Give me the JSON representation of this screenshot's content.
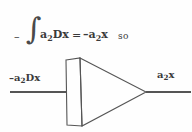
{
  "figure": {
    "kind": "operational-amplifier-integrator-diagram",
    "background_color": "#fefefe",
    "ink_color": "#3a3a3a"
  },
  "equation": {
    "minus": "–",
    "integral": "∫",
    "integrand_base": "a",
    "integrand_sub": "2",
    "integrand_rest": "Dx",
    "equals": "=",
    "result_minus": "–a",
    "result_sub": "2",
    "result_rest": "x",
    "connector": "so",
    "plain_text": "– ∫ a₂Dx = –a₂x    so"
  },
  "circuit": {
    "input_label": {
      "minus": "–a",
      "sub": "2",
      "rest": "Dx",
      "plain_text": "–a₂Dx"
    },
    "output_label": {
      "base": "a",
      "sub": "2",
      "rest": "x",
      "plain_text": "a₂x"
    },
    "geometry": {
      "input_wire": {
        "x1": 10,
        "y1": 92,
        "x2": 67,
        "y2": 92
      },
      "output_wire": {
        "x1": 146,
        "y1": 92,
        "x2": 191,
        "y2": 92
      },
      "block_rect": {
        "top_left_x": 66,
        "top_left_y": 60,
        "top_right_x": 80,
        "top_right_y": 58,
        "bottom_right_x": 82,
        "bottom_right_y": 126,
        "bottom_left_x": 67,
        "bottom_left_y": 125
      },
      "triangle": {
        "top_x": 80,
        "top_y": 58,
        "bottom_x": 82,
        "bottom_y": 126,
        "apex_x": 146,
        "apex_y": 92
      }
    },
    "stroke_width": 1
  }
}
